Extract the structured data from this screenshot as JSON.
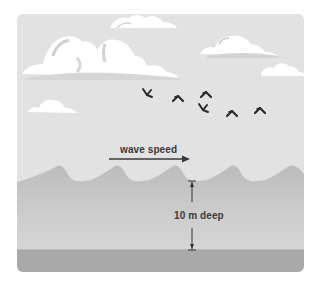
{
  "diagram": {
    "labels": {
      "wave_speed": "wave speed",
      "depth": "10 m deep"
    },
    "elements": {
      "sky": "sky",
      "clouds": 6,
      "birds": 6,
      "sea_surface": "waves",
      "seabed": "sea floor"
    },
    "colors": {
      "background": "#ffffff",
      "sky": "#e2e2e2",
      "cloud": "#ffffff",
      "cloud_shadow": "#d2d2d2",
      "sea": "#bdbdbd",
      "sea_light": "#cfcfcf",
      "seabed": "#a9a9a9",
      "ink": "#2c2c2c"
    }
  }
}
